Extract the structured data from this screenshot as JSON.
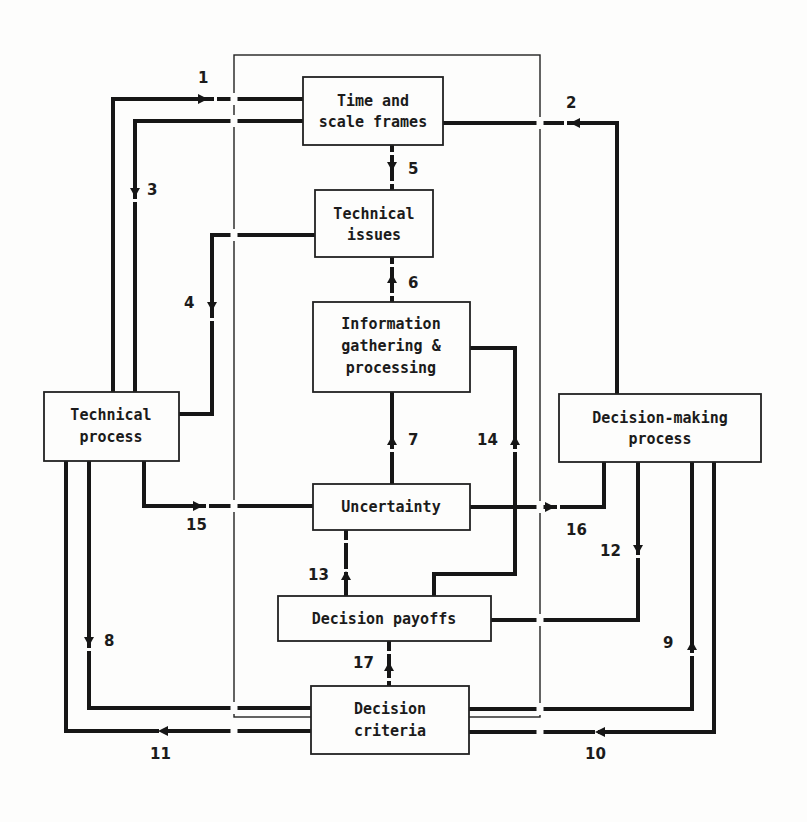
{
  "diagram": {
    "frame": {
      "x": 234,
      "y": 55,
      "w": 306,
      "h": 662
    },
    "boxes": [
      {
        "id": "time",
        "lines": [
          "Time and",
          "scale frames"
        ],
        "x": 303,
        "y": 77,
        "w": 140,
        "h": 68
      },
      {
        "id": "tech_issues",
        "lines": [
          "Technical",
          "issues"
        ],
        "x": 315,
        "y": 190,
        "w": 118,
        "h": 67
      },
      {
        "id": "info",
        "lines": [
          "Information",
          "gathering &",
          "processing"
        ],
        "x": 313,
        "y": 302,
        "w": 157,
        "h": 90
      },
      {
        "id": "uncert",
        "lines": [
          "Uncertainty"
        ],
        "x": 313,
        "y": 484,
        "w": 157,
        "h": 46
      },
      {
        "id": "payoffs",
        "lines": [
          "Decision payoffs"
        ],
        "x": 278,
        "y": 596,
        "w": 213,
        "h": 45
      },
      {
        "id": "criteria",
        "lines": [
          "Decision",
          "criteria"
        ],
        "x": 311,
        "y": 686,
        "w": 158,
        "h": 68
      },
      {
        "id": "tech_proc",
        "lines": [
          "Technical",
          "process"
        ],
        "x": 44,
        "y": 392,
        "w": 135,
        "h": 69
      },
      {
        "id": "dm_proc",
        "lines": [
          "Decision-making",
          "process"
        ],
        "x": 559,
        "y": 394,
        "w": 202,
        "h": 68
      }
    ],
    "labels": [
      {
        "text": "1",
        "x": 204,
        "y": 83
      },
      {
        "text": "2",
        "x": 572,
        "y": 108
      },
      {
        "text": "3",
        "x": 156,
        "y": 195
      },
      {
        "text": "4",
        "x": 190,
        "y": 308
      },
      {
        "text": "5",
        "x": 414,
        "y": 174
      },
      {
        "text": "6",
        "x": 414,
        "y": 288
      },
      {
        "text": "7",
        "x": 414,
        "y": 445
      },
      {
        "text": "8",
        "x": 111,
        "y": 646
      },
      {
        "text": "9",
        "x": 670,
        "y": 648
      },
      {
        "text": "10",
        "x": 595,
        "y": 759
      },
      {
        "text": "11",
        "x": 160,
        "y": 759
      },
      {
        "text": "12",
        "x": 613,
        "y": 556
      },
      {
        "text": "13",
        "x": 318,
        "y": 580
      },
      {
        "text": "14",
        "x": 487,
        "y": 445
      },
      {
        "text": "15",
        "x": 196,
        "y": 530
      },
      {
        "text": "16",
        "x": 577,
        "y": 535
      },
      {
        "text": "17",
        "x": 363,
        "y": 668
      }
    ],
    "colors": {
      "line": "#161616",
      "background": "#fdfdfc"
    }
  }
}
